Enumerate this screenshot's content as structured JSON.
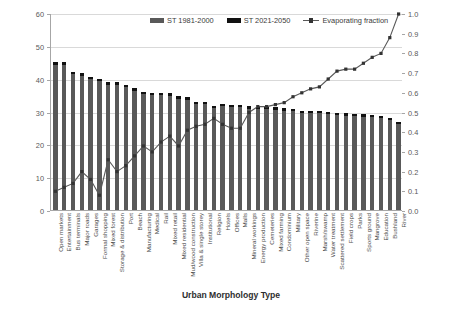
{
  "chart_data": {
    "type": "bar",
    "title": "",
    "xlabel": "Urban Morphology Type",
    "ylabel": "Maximum surface temperature [°C]",
    "ylabel_right": "Evaporating fraction (vegetation & water)",
    "ylim": [
      0,
      60
    ],
    "yticks": [
      "0",
      "10",
      "20",
      "30",
      "40",
      "50",
      "60"
    ],
    "ylim_right": [
      0,
      1.0
    ],
    "yticks_right": [
      "0.0",
      "0.1",
      "0.2",
      "0.3",
      "0.4",
      "0.5",
      "0.6",
      "0.7",
      "0.8",
      "0.9",
      "1.0"
    ],
    "grid": true,
    "legend_position": "top-center",
    "categories": [
      "Open markets",
      "Entertainment",
      "Bus terminals",
      "Major roads",
      "Garages",
      "Formal shopping",
      "Mixed forest",
      "Storage & distribution",
      "Port",
      "Beach",
      "Manufacturing",
      "Medical",
      "Rail",
      "Mixed retail",
      "Mixed residential",
      "Mud/wood construction",
      "Villa & single storey",
      "Institutional",
      "Religion",
      "Hotels",
      "Offices",
      "Malls",
      "Mineral workings",
      "Energy production",
      "Cemeteries",
      "Mixed farming",
      "Condominium",
      "Military",
      "Other open space",
      "Riverine",
      "Marsh/swamp",
      "Water treatment",
      "Scattered settlement",
      "Field crops",
      "Parks",
      "Sports ground",
      "Mangrove",
      "Education",
      "Bushland",
      "River"
    ],
    "series": [
      {
        "name": "ST 1981-2000",
        "color": "#595959",
        "values": [
          44.3,
          44.3,
          41.3,
          40.9,
          39.9,
          39.3,
          38.2,
          38.2,
          37.5,
          36.4,
          35.4,
          35.0,
          34.9,
          34.8,
          33.9,
          33.6,
          32.3,
          32.3,
          31.1,
          31.6,
          31.4,
          31.4,
          30.9,
          30.8,
          30.7,
          30.6,
          30.3,
          30.2,
          29.6,
          29.6,
          29.4,
          29.2,
          28.9,
          28.7,
          28.5,
          28.4,
          28.2,
          28.0,
          27.4,
          26.2
        ]
      },
      {
        "name": "ST 2021-2050",
        "color": "#111111",
        "values": [
          45.0,
          45.0,
          42.0,
          41.6,
          40.5,
          40.0,
          38.9,
          38.9,
          38.2,
          37.1,
          36.0,
          35.7,
          35.6,
          35.5,
          34.6,
          34.3,
          33.0,
          33.0,
          31.8,
          32.3,
          32.1,
          32.1,
          31.6,
          31.5,
          31.4,
          31.3,
          31.0,
          30.9,
          30.3,
          30.3,
          30.1,
          29.9,
          29.6,
          29.4,
          29.2,
          29.1,
          28.9,
          28.7,
          28.1,
          26.9
        ]
      },
      {
        "name": "Evaporating fraction",
        "color": "#595959",
        "axis": "right",
        "values": [
          0.1,
          0.12,
          0.14,
          0.2,
          0.16,
          0.08,
          0.26,
          0.2,
          0.23,
          0.28,
          0.33,
          0.3,
          0.35,
          0.38,
          0.33,
          0.41,
          0.43,
          0.44,
          0.47,
          0.44,
          0.42,
          0.42,
          0.5,
          0.53,
          0.53,
          0.54,
          0.55,
          0.58,
          0.6,
          0.62,
          0.63,
          0.67,
          0.71,
          0.72,
          0.72,
          0.75,
          0.78,
          0.8,
          0.88,
          1.0
        ]
      }
    ]
  },
  "legend": {
    "items": [
      {
        "label": "ST 1981-2000",
        "marker": "grey-bar-swatch"
      },
      {
        "label": "ST 2021-2050",
        "marker": "black-bar-swatch"
      },
      {
        "label": "Evaporating fraction",
        "marker": "line-marker-swatch"
      }
    ]
  }
}
